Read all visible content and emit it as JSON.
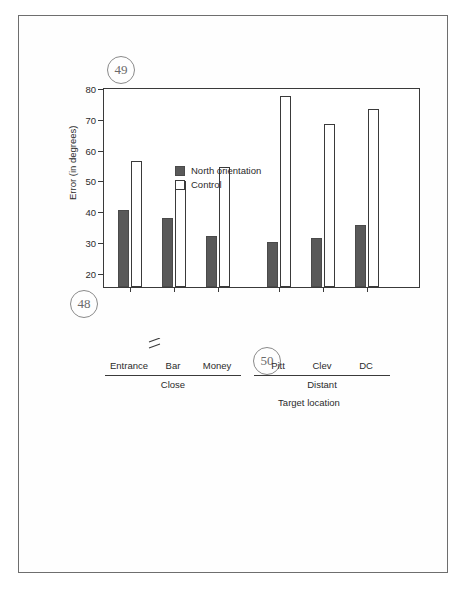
{
  "page": {
    "figure_refs": [
      {
        "id": "ref-49",
        "number": "49"
      },
      {
        "id": "ref-48",
        "number": "48"
      },
      {
        "id": "ref-50",
        "number": "50"
      }
    ]
  },
  "chart_data": {
    "type": "bar",
    "title": "",
    "xlabel": "Target location",
    "ylabel": "Error (in degrees)",
    "ylim": [
      15,
      80
    ],
    "yticks": [
      20,
      30,
      40,
      50,
      60,
      70,
      80
    ],
    "ytick_labels": [
      "20",
      "30",
      "40",
      "50",
      "60",
      "70",
      "80"
    ],
    "axis_break": true,
    "grid": false,
    "legend_position": "top-left",
    "categories": [
      "Entrance",
      "Bar",
      "Money",
      "Pitt",
      "Clev",
      "DC"
    ],
    "groups": [
      {
        "name": "Close",
        "categories": [
          "Entrance",
          "Bar",
          "Money"
        ]
      },
      {
        "name": "Distant",
        "categories": [
          "Pitt",
          "Clev",
          "DC"
        ]
      }
    ],
    "series": [
      {
        "name": "North orientation",
        "color": "#595959",
        "values": [
          40,
          37.5,
          31.5,
          29.5,
          31,
          35
        ]
      },
      {
        "name": "Control",
        "color": "#ffffff",
        "values": [
          56,
          49.5,
          54,
          77,
          68,
          73
        ]
      }
    ]
  }
}
